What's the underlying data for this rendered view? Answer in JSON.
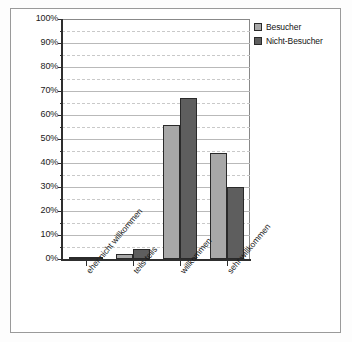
{
  "chart_data": {
    "type": "bar",
    "title": "",
    "subtitle": "",
    "xlabel": "",
    "ylabel": "",
    "categories": [
      "eher nicht willkommen",
      "teils-teils",
      "willkommen",
      "sehr willkommen"
    ],
    "series": [
      {
        "name": "Besucher",
        "color": "#a8a8a8",
        "values": [
          1,
          2,
          56,
          44
        ]
      },
      {
        "name": "Nicht-Besucher",
        "color": "#5e5e5e",
        "values": [
          1,
          4,
          67,
          30
        ]
      }
    ],
    "ylim": [
      0,
      100
    ],
    "ytick_labels": [
      "0%",
      "10%",
      "20%",
      "30%",
      "40%",
      "50%",
      "60%",
      "70%",
      "80%",
      "90%",
      "100%"
    ],
    "ytick_values": [
      0,
      10,
      20,
      30,
      40,
      50,
      60,
      70,
      80,
      90,
      100
    ],
    "yminor_values": [
      5,
      15,
      25,
      35,
      45,
      55,
      65,
      75,
      85,
      95
    ],
    "grid": true,
    "legend_position": "top-right",
    "value_suffix": "%"
  },
  "legend": {
    "entries": [
      {
        "label": "Besucher",
        "color": "#a8a8a8"
      },
      {
        "label": "Nicht-Besucher",
        "color": "#5e5e5e"
      }
    ]
  }
}
